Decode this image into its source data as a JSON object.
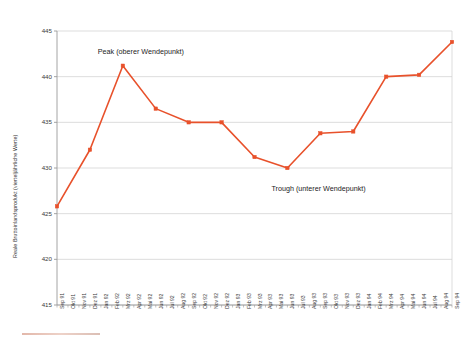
{
  "chart_data": {
    "type": "line",
    "title": "",
    "xlabel": "",
    "ylabel": "Reale Bruttoinlandsprodukt (vierteljährliche Werte)",
    "ylim": [
      415,
      445
    ],
    "ytick_values": [
      415,
      420,
      425,
      430,
      435,
      440,
      445
    ],
    "ytick_labels": [
      "415",
      "420",
      "425",
      "430",
      "435",
      "440",
      "445"
    ],
    "grid": true,
    "legend": "none",
    "line_color": "#E8512B",
    "marker_color": "#E8512B",
    "categories": [
      "Sep 91",
      "Okt 91",
      "Nov 91",
      "Dez 91",
      "Jan 92",
      "Feb 92",
      "Mrz 92",
      "Apr 92",
      "Mai 92",
      "Jun 92",
      "Jul 92",
      "Aug 92",
      "Sep 92",
      "Okt 92",
      "Nov 92",
      "Dez 92",
      "Jan 93",
      "Feb 93",
      "Mrz 93",
      "Apr 93",
      "Mai 93",
      "Jun 93",
      "Jul 93",
      "Aug 93",
      "Sep 93",
      "Okt 93",
      "Nov 93",
      "Dez 93",
      "Jan 94",
      "Feb 94",
      "Mrz 94",
      "Apr 94",
      "Mai 94",
      "Jun 94",
      "Jul 94",
      "Aug 94",
      "Sep 94"
    ],
    "points": [
      {
        "x": "Sep 91",
        "index": 0,
        "value": 425.8
      },
      {
        "x": "Dez 91",
        "index": 3,
        "value": 432.0
      },
      {
        "x": "Mrz 92",
        "index": 6,
        "value": 441.2
      },
      {
        "x": "Jun 92",
        "index": 9,
        "value": 436.5
      },
      {
        "x": "Sep 92",
        "index": 12,
        "value": 435.0
      },
      {
        "x": "Dez 92",
        "index": 15,
        "value": 435.0
      },
      {
        "x": "Mrz 93",
        "index": 18,
        "value": 431.2
      },
      {
        "x": "Jun 93",
        "index": 21,
        "value": 430.0
      },
      {
        "x": "Sep 93",
        "index": 24,
        "value": 433.8
      },
      {
        "x": "Dez 93",
        "index": 27,
        "value": 434.0
      },
      {
        "x": "Mrz 94",
        "index": 30,
        "value": 440.0
      },
      {
        "x": "Jun 94",
        "index": 33,
        "value": 440.2
      },
      {
        "x": "Sep 94",
        "index": 36,
        "value": 443.8
      }
    ],
    "annotations": [
      {
        "id": "peak",
        "text": "Peak (oberer Wendepunkt)",
        "anchor_index": 6,
        "anchor_value": 441.2
      },
      {
        "id": "trough",
        "text": "Trough (unterer Wendepunkt)",
        "anchor_index": 21,
        "anchor_value": 430.0
      }
    ]
  }
}
